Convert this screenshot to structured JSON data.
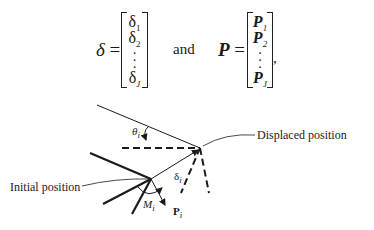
{
  "equation": {
    "delta_symbol": "δ",
    "equals": "=",
    "delta_vector": [
      "δ₁",
      "δ₂",
      "⋮",
      "δⱼ"
    ],
    "delta_entries": {
      "e1": "δ",
      "e1_sub": "1",
      "e2": "δ",
      "e2_sub": "2",
      "eJ": "δ",
      "eJ_sub": "J"
    },
    "conjunction": "and",
    "p_symbol": "P",
    "p_entries": {
      "e1": "P",
      "e1_sub": "1",
      "e2": "P",
      "e2_sub": "2",
      "eJ": "P",
      "eJ_sub": "J"
    },
    "trailing_punct": ","
  },
  "diagram": {
    "labels": {
      "displaced_position": "Displaced position",
      "initial_position": "Initial position",
      "theta": "θ",
      "theta_sub": "i",
      "delta": "δ",
      "delta_sub": "i",
      "moment": "M",
      "moment_sub": "i",
      "force": "P",
      "force_sub": "i"
    },
    "colors": {
      "ink": "#1a1a1a"
    }
  }
}
